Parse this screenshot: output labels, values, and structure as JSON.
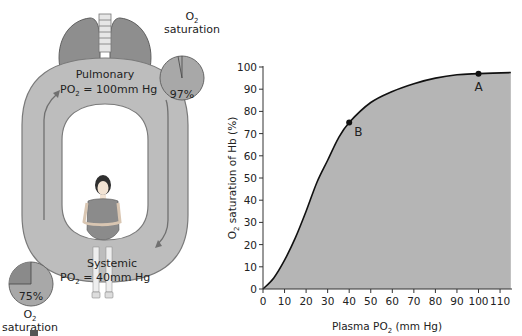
{
  "diagram": {
    "pulmonary": {
      "title": "Pulmonary",
      "po2_prefix": "PO",
      "po2_sub": "2",
      "po2_value": " = 100mm Hg"
    },
    "systemic": {
      "title": "Systemic",
      "po2_prefix": "PO",
      "po2_sub": "2",
      "po2_value": " = 40mm Hg"
    },
    "pie_top": {
      "label_main": "O",
      "label_sub": "2",
      "label_line2": "saturation",
      "percent_label": "97%",
      "percent": 97
    },
    "pie_bottom": {
      "label_main": "O",
      "label_sub": "2",
      "label_line2": "saturation",
      "percent_label": "75%",
      "percent": 75
    },
    "colors": {
      "loop": "#bdbdbd",
      "loop_stroke": "#7a7a7a",
      "lung": "#8e8e8e",
      "pie_fill": "#a8a8a8",
      "pie_dark": "#8a8a8a",
      "chart_fill": "#b5b5b5",
      "curve": "#111111"
    }
  },
  "chart_data": {
    "type": "area",
    "title": "",
    "xlabel": "Plasma PO2 (mm Hg)",
    "xlabel_main": "Plasma PO",
    "xlabel_sub": "2",
    "xlabel_tail": " (mm Hg)",
    "ylabel": "O2 saturation of Hb (%)",
    "ylabel_main": "O",
    "ylabel_sub": "2",
    "ylabel_tail": " saturation of Hb (%)",
    "xlim": [
      0,
      115
    ],
    "ylim": [
      0,
      100
    ],
    "x_ticks": [
      "0",
      "10",
      "20",
      "30",
      "40",
      "50",
      "60",
      "70",
      "80",
      "90",
      "100",
      "110"
    ],
    "y_ticks": [
      "0",
      "10",
      "20",
      "30",
      "40",
      "50",
      "60",
      "70",
      "80",
      "90",
      "100"
    ],
    "grid": false,
    "series": [
      {
        "name": "Oxyhemoglobin dissociation curve",
        "x": [
          0,
          5,
          10,
          15,
          20,
          25,
          30,
          35,
          40,
          50,
          60,
          70,
          80,
          90,
          100,
          115
        ],
        "y": [
          0,
          5,
          13,
          23,
          35,
          48,
          58,
          68,
          75,
          84,
          89,
          92.5,
          95,
          96.5,
          97,
          97.5
        ]
      }
    ],
    "annotations": [
      {
        "label": "A",
        "x": 100,
        "y": 97
      },
      {
        "label": "B",
        "x": 40,
        "y": 75
      }
    ]
  }
}
